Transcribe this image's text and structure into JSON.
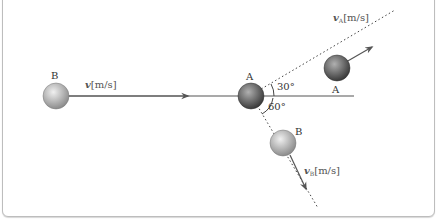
{
  "diagram": {
    "title_fragment": "",
    "ball_B_initial": {
      "label": "B",
      "velocity_label": "v[m/s]",
      "velocity_symbol": "v",
      "unit": "[m/s]"
    },
    "ball_A_collision": {
      "label": "A"
    },
    "ball_A_after": {
      "label": "A",
      "velocity_label": "vA[m/s]",
      "velocity_symbol": "v",
      "subscript": "A",
      "unit": "[m/s]"
    },
    "ball_B_after": {
      "label": "B",
      "velocity_label": "vB[m/s]",
      "velocity_symbol": "v",
      "subscript": "B",
      "unit": "[m/s]"
    },
    "angles": {
      "upper": "30°",
      "lower": "60°"
    },
    "colors": {
      "line": "#555555",
      "dotted": "#444444",
      "ball_light": "#e0e0e0",
      "ball_dark": "#5a5a5a"
    }
  }
}
